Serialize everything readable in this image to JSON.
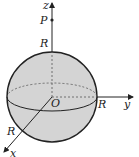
{
  "figure": {
    "type": "sphere-with-axes",
    "labels": {
      "z_axis": "z",
      "y_axis": "y",
      "x_axis": "x",
      "point": "P",
      "origin": "O",
      "radius_top": "R",
      "radius_right": "R",
      "radius_front": "R"
    },
    "colors": {
      "sphere_fill": "#d4d4d4",
      "stroke": "#222222",
      "background": "#ffffff"
    }
  }
}
